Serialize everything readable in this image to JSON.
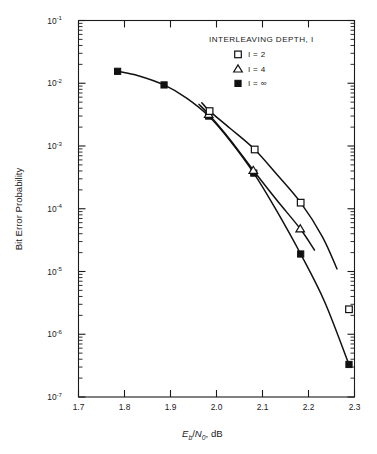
{
  "chart_data": {
    "type": "line",
    "title": "",
    "xlabel": "Eb/N0, dB",
    "xlabel_parts": {
      "main1": "E",
      "sub1": "b",
      "slash": "/",
      "main2": "N",
      "sub2": "0",
      "tail": ", dB"
    },
    "ylabel": "Bit Error Probability",
    "xlim": [
      1.7,
      2.3
    ],
    "ylim": [
      1e-07,
      0.1
    ],
    "xscale": "linear",
    "yscale": "log",
    "grid": false,
    "xticks": [
      1.7,
      1.8,
      1.9,
      2.0,
      2.1,
      2.2,
      2.3
    ],
    "xtick_labels": [
      "1.7",
      "1.8",
      "1.9",
      "2.0",
      "2.1",
      "2.2",
      "2.3"
    ],
    "ytick_labels": [
      "10-1",
      "10-2",
      "10-3",
      "10-4",
      "10-5",
      "10-6",
      "10-7"
    ],
    "ytick_mantissa": "10",
    "ytick_exponents": [
      "-1",
      "-2",
      "-3",
      "-4",
      "-5",
      "-6",
      "-7"
    ],
    "legend_position": "upper-right",
    "legend_title": "INTERLEAVING DEPTH, I",
    "series": [
      {
        "name": "I = 2",
        "marker": "open-square",
        "values": [
          {
            "x": 1.985,
            "y": 0.0036
          },
          {
            "x": 2.083,
            "y": 0.00088
          },
          {
            "x": 2.183,
            "y": 0.000125
          },
          {
            "x": 2.288,
            "y": 2.5e-06
          }
        ],
        "curve": [
          {
            "x": 1.968,
            "y": 0.0049
          },
          {
            "x": 1.985,
            "y": 0.0036
          },
          {
            "x": 2.03,
            "y": 0.0019
          },
          {
            "x": 2.083,
            "y": 0.00088
          },
          {
            "x": 2.13,
            "y": 0.00036
          },
          {
            "x": 2.183,
            "y": 0.000125
          },
          {
            "x": 2.23,
            "y": 3.6e-05
          },
          {
            "x": 2.262,
            "y": 1.1e-05
          }
        ]
      },
      {
        "name": "I = 4",
        "marker": "open-triangle",
        "values": [
          {
            "x": 1.983,
            "y": 0.0032
          },
          {
            "x": 2.08,
            "y": 0.00041
          },
          {
            "x": 2.182,
            "y": 4.8e-05
          }
        ],
        "curve": [
          {
            "x": 1.962,
            "y": 0.0046
          },
          {
            "x": 1.983,
            "y": 0.0032
          },
          {
            "x": 2.03,
            "y": 0.00125
          },
          {
            "x": 2.08,
            "y": 0.00041
          },
          {
            "x": 2.13,
            "y": 0.00014
          },
          {
            "x": 2.182,
            "y": 4.8e-05
          },
          {
            "x": 2.213,
            "y": 2.2e-05
          }
        ]
      },
      {
        "name": "I = ∞",
        "marker": "filled-square",
        "values": [
          {
            "x": 1.785,
            "y": 0.0155
          },
          {
            "x": 1.886,
            "y": 0.0094
          },
          {
            "x": 1.983,
            "y": 0.003
          },
          {
            "x": 2.081,
            "y": 0.00037
          },
          {
            "x": 2.183,
            "y": 1.9e-05
          },
          {
            "x": 2.288,
            "y": 3.3e-07
          }
        ],
        "curve": [
          {
            "x": 1.785,
            "y": 0.0155
          },
          {
            "x": 1.83,
            "y": 0.0132
          },
          {
            "x": 1.886,
            "y": 0.0094
          },
          {
            "x": 1.935,
            "y": 0.0058
          },
          {
            "x": 1.983,
            "y": 0.003
          },
          {
            "x": 2.03,
            "y": 0.0012
          },
          {
            "x": 2.081,
            "y": 0.00037
          },
          {
            "x": 2.13,
            "y": 9.5e-05
          },
          {
            "x": 2.183,
            "y": 1.9e-05
          },
          {
            "x": 2.235,
            "y": 3.3e-06
          },
          {
            "x": 2.288,
            "y": 3.3e-07
          }
        ]
      }
    ],
    "legend_entries": [
      {
        "label": "I = 2",
        "marker": "open-square"
      },
      {
        "label": "I = 4",
        "marker": "open-triangle"
      },
      {
        "label": "I = ∞",
        "marker": "filled-square"
      }
    ]
  },
  "colors": {
    "ink": "#111111",
    "background": "#ffffff"
  }
}
